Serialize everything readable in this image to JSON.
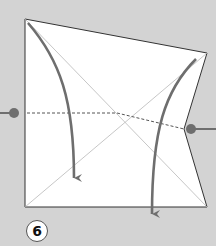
{
  "diagram": {
    "type": "origami-instruction-step",
    "step_number": "6",
    "colors": {
      "background": "#d3d3d3",
      "paper": "#ffffff",
      "paper_edge": "#333333",
      "crease": "#b8b8b8",
      "fold_line": "#555555",
      "arrow": "#6e6e6e",
      "pointer_dot": "#6e6e6e"
    },
    "paper_outline": [
      [
        25,
        19
      ],
      [
        207,
        53
      ],
      [
        184,
        129
      ],
      [
        207,
        207
      ],
      [
        25,
        207
      ]
    ],
    "creases": [
      {
        "from": [
          25,
          19
        ],
        "to": [
          207,
          207
        ]
      },
      {
        "from": [
          207,
          53
        ],
        "to": [
          25,
          207
        ]
      }
    ],
    "valley_fold_line": [
      [
        25,
        113
      ],
      [
        117,
        113
      ],
      [
        184,
        129
      ]
    ],
    "arrows": [
      {
        "name": "left-fold-arrow",
        "from": [
          28,
          23
        ],
        "to": [
          74,
          183
        ]
      },
      {
        "name": "right-fold-arrow",
        "from": [
          196,
          59
        ],
        "to": [
          152,
          219
        ]
      }
    ],
    "pointers": [
      {
        "name": "left-pointer",
        "dot": [
          14,
          113
        ],
        "line_from": [
          0,
          113
        ]
      },
      {
        "name": "right-pointer",
        "dot": [
          191,
          129
        ],
        "line_to": [
          216,
          129
        ]
      }
    ]
  }
}
